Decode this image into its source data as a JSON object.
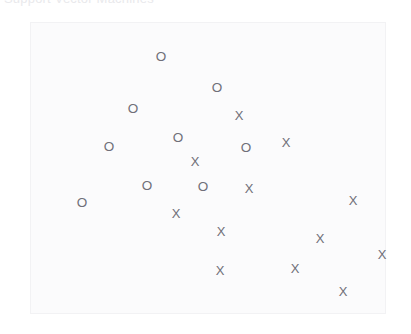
{
  "header": {
    "title_text": "Support Vector Machines",
    "title_color": "#e9e9ec"
  },
  "plot": {
    "background_color": "#fbfbfc",
    "border_color": "#f2f2f4",
    "marker_color": "#6f6f78",
    "left": 30,
    "top": 22,
    "width": 356,
    "height": 292
  },
  "chart_data": {
    "type": "scatter",
    "title": "Support Vector Machines",
    "xlabel": "",
    "ylabel": "",
    "xlim": [
      0,
      356
    ],
    "ylim": [
      0,
      292
    ],
    "grid": false,
    "legend": "none",
    "axis_ticks": false,
    "marker_glyphs": {
      "class_o": "O",
      "class_x": "X"
    },
    "series": [
      {
        "name": "Class O",
        "glyph": "O",
        "points": [
          {
            "x": 130,
            "y": 34
          },
          {
            "x": 186,
            "y": 65
          },
          {
            "x": 102,
            "y": 86
          },
          {
            "x": 147,
            "y": 115
          },
          {
            "x": 78,
            "y": 124
          },
          {
            "x": 215,
            "y": 125
          },
          {
            "x": 116,
            "y": 163
          },
          {
            "x": 172,
            "y": 164
          },
          {
            "x": 51,
            "y": 180
          }
        ]
      },
      {
        "name": "Class X",
        "glyph": "X",
        "points": [
          {
            "x": 208,
            "y": 92
          },
          {
            "x": 255,
            "y": 119
          },
          {
            "x": 164,
            "y": 138
          },
          {
            "x": 218,
            "y": 165
          },
          {
            "x": 145,
            "y": 190
          },
          {
            "x": 322,
            "y": 177
          },
          {
            "x": 190,
            "y": 208
          },
          {
            "x": 289,
            "y": 215
          },
          {
            "x": 351,
            "y": 231
          },
          {
            "x": 189,
            "y": 247
          },
          {
            "x": 264,
            "y": 245
          },
          {
            "x": 312,
            "y": 268
          }
        ]
      }
    ]
  }
}
